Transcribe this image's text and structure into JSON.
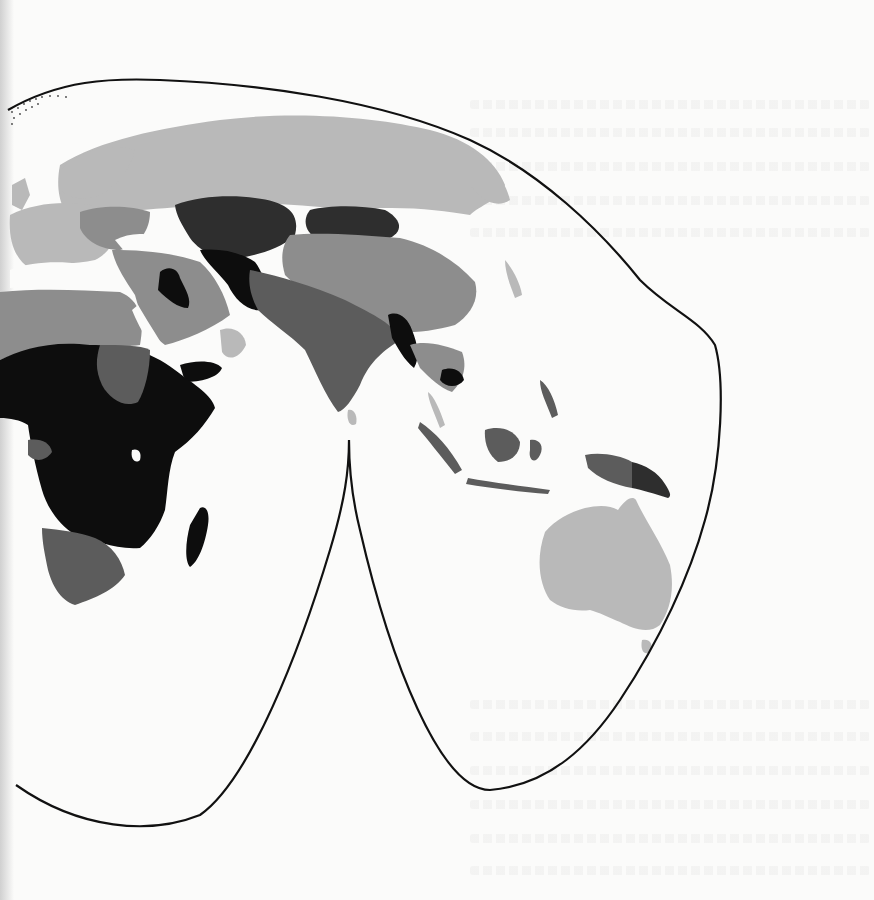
{
  "map": {
    "projection": "interrupted-homolosine-eastern-hemisphere",
    "region_shown": "Europe, Africa, Asia, Oceania",
    "outline_color": "#111111",
    "ocean_color": "#fbfbfa",
    "shade_classes": [
      {
        "id": "class-1",
        "color": "#b9b9b9"
      },
      {
        "id": "class-2",
        "color": "#8d8d8d"
      },
      {
        "id": "class-3",
        "color": "#5c5c5c"
      },
      {
        "id": "class-4",
        "color": "#2e2e2e"
      },
      {
        "id": "class-5",
        "color": "#0d0d0d"
      }
    ],
    "regions": [
      {
        "name": "Russia / Northern Europe",
        "class": "class-1"
      },
      {
        "name": "Western Europe",
        "class": "class-1"
      },
      {
        "name": "Eastern Europe",
        "class": "class-2"
      },
      {
        "name": "North Africa",
        "class": "class-2"
      },
      {
        "name": "Middle East",
        "class": "class-2"
      },
      {
        "name": "Arabian Peninsula",
        "class": "class-2"
      },
      {
        "name": "Iraq",
        "class": "class-5"
      },
      {
        "name": "Kazakhstan / Central Asia",
        "class": "class-4"
      },
      {
        "name": "Afghanistan",
        "class": "class-5"
      },
      {
        "name": "Mongolia",
        "class": "class-4"
      },
      {
        "name": "China",
        "class": "class-2"
      },
      {
        "name": "South Asia / India",
        "class": "class-3"
      },
      {
        "name": "Myanmar",
        "class": "class-5"
      },
      {
        "name": "Southeast Asia",
        "class": "class-2"
      },
      {
        "name": "Cambodia",
        "class": "class-5"
      },
      {
        "name": "Indonesia",
        "class": "class-3"
      },
      {
        "name": "Papua New Guinea",
        "class": "class-4"
      },
      {
        "name": "Sub-Saharan Africa",
        "class": "class-5"
      },
      {
        "name": "Sudan",
        "class": "class-3"
      },
      {
        "name": "Southern Africa",
        "class": "class-3"
      },
      {
        "name": "Madagascar",
        "class": "class-5"
      },
      {
        "name": "Sri Lanka",
        "class": "class-1"
      },
      {
        "name": "Japan / East Asia coast",
        "class": "class-1"
      },
      {
        "name": "Australia",
        "class": "class-1"
      },
      {
        "name": "New Zealand",
        "class": "class-1"
      }
    ]
  }
}
